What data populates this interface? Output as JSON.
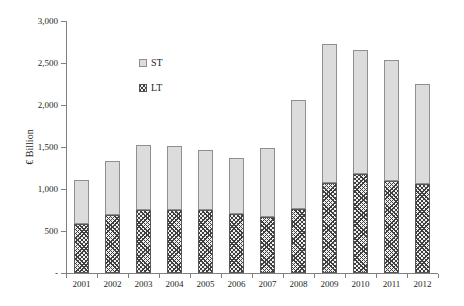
{
  "chart_data": {
    "type": "bar",
    "stacked": true,
    "ylabel": "€ Billion",
    "categories": [
      "2001",
      "2002",
      "2003",
      "2004",
      "2005",
      "2006",
      "2007",
      "2008",
      "2009",
      "2010",
      "2011",
      "2012"
    ],
    "series": [
      {
        "name": "ST",
        "values": [
          520,
          645,
          765,
          760,
          710,
          675,
          820,
          1300,
          1660,
          1470,
          1430,
          1190
        ]
      },
      {
        "name": "LT",
        "values": [
          585,
          690,
          755,
          750,
          755,
          700,
          670,
          765,
          1070,
          1180,
          1100,
          1060
        ]
      }
    ],
    "stack_order_bottom_to_top": [
      "LT",
      "ST"
    ],
    "ylim": [
      0,
      3000
    ],
    "y_ticks": [
      {
        "value": 0,
        "label": "-"
      },
      {
        "value": 500,
        "label": "500"
      },
      {
        "value": 1000,
        "label": "1,000"
      },
      {
        "value": 1500,
        "label": "1,500"
      },
      {
        "value": 2000,
        "label": "2,000"
      },
      {
        "value": 2500,
        "label": "2,500"
      },
      {
        "value": 3000,
        "label": "3,000"
      }
    ],
    "grid": false,
    "legend": {
      "position": "inside-top-left",
      "entries": [
        "ST",
        "LT"
      ]
    },
    "colors": {
      "st_fill": "#dcdcdc",
      "st_border": "#8f8f8f",
      "lt_hatch": "#3f3f3f",
      "lt_bg": "#f0f0f0",
      "lt_border": "#565656",
      "axis": "#808080",
      "text": "#262626"
    }
  }
}
